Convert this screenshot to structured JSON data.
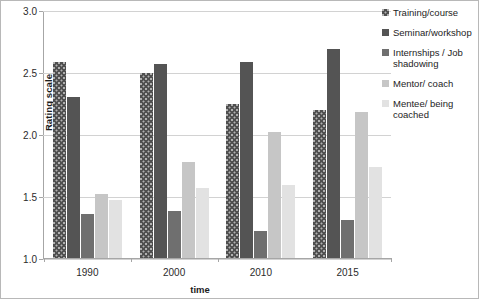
{
  "chart_data": {
    "type": "bar",
    "title": "",
    "xlabel": "time",
    "ylabel": "Rating scale",
    "categories": [
      "1990",
      "2000",
      "2010",
      "2015"
    ],
    "ylim": [
      1.0,
      3.0
    ],
    "yticks": [
      "1.0",
      "1.5",
      "2.0",
      "2.5",
      "3.0"
    ],
    "ytick_values": [
      1.0,
      1.5,
      2.0,
      2.5,
      3.0
    ],
    "grid": true,
    "legend_position": "right",
    "series": [
      {
        "name": "Training/course",
        "color": "#4f4f4f",
        "pattern": "dotted",
        "values": [
          2.59,
          2.5,
          2.25,
          2.2
        ]
      },
      {
        "name": "Seminar/workshop",
        "color": "#545454",
        "pattern": "solid",
        "values": [
          2.3,
          2.57,
          2.59,
          2.69
        ]
      },
      {
        "name": "Internships / Job shadowing",
        "color": "#6f6f6f",
        "pattern": "solid",
        "values": [
          1.36,
          1.38,
          1.22,
          1.31
        ]
      },
      {
        "name": "Mentor/ coach",
        "color": "#c6c6c6",
        "pattern": "solid",
        "values": [
          1.52,
          1.78,
          2.02,
          2.18
        ]
      },
      {
        "name": "Mentee/ being coached",
        "color": "#e2e2e2",
        "pattern": "solid",
        "values": [
          1.47,
          1.57,
          1.59,
          1.74
        ]
      }
    ]
  }
}
